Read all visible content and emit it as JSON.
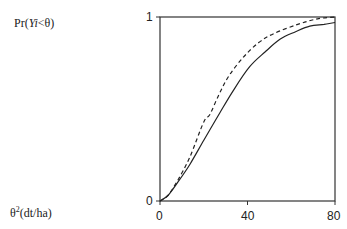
{
  "chart_data": {
    "type": "line",
    "title": "",
    "ylabel_prefix": "Pr(",
    "ylabel_var": "Yi",
    "ylabel_suffix": "<θ)",
    "xlabel_base": "θ",
    "xlabel_sup": "2",
    "xlabel_units": "(dt/ha)",
    "xlim": [
      0,
      80
    ],
    "ylim": [
      0,
      1
    ],
    "x_ticks": [
      0,
      40,
      80
    ],
    "x_tick_labels": [
      "0",
      "40",
      "80"
    ],
    "y_ticks": [
      0,
      1
    ],
    "y_tick_labels": [
      "0",
      "1"
    ],
    "grid": false,
    "legend": null,
    "series": [
      {
        "name": "solid curve",
        "style": "solid",
        "color": "#222222",
        "x": [
          0,
          3.6,
          8,
          13.7,
          20,
          27.4,
          34,
          41,
          48,
          55,
          62,
          68.5,
          75,
          80
        ],
        "y": [
          0,
          0.03,
          0.1,
          0.2,
          0.33,
          0.48,
          0.61,
          0.73,
          0.81,
          0.88,
          0.92,
          0.95,
          0.96,
          0.97
        ]
      },
      {
        "name": "dashed curve",
        "style": "dashed",
        "color": "#222222",
        "x": [
          0,
          3.6,
          8,
          13.7,
          20,
          22.8,
          27,
          31.5,
          38,
          45,
          52,
          63,
          72,
          80
        ],
        "y": [
          0,
          0.03,
          0.11,
          0.24,
          0.43,
          0.47,
          0.58,
          0.68,
          0.78,
          0.86,
          0.91,
          0.96,
          0.99,
          1.0
        ]
      }
    ]
  }
}
